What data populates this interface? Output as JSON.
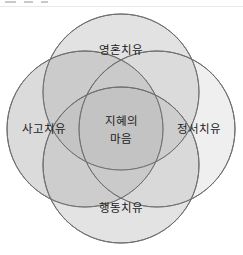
{
  "figure": {
    "name": "four-circle-venn-diagram",
    "background_color": "#ffffff",
    "stroke_color": "#6e6e6e"
  },
  "top_strip": {
    "present": true,
    "description": "clipped-toolbar-remnant"
  },
  "diagram": {
    "center": {
      "line1": "지혜의",
      "line2": "마음",
      "fill": "#d9d9d9"
    },
    "circles": [
      {
        "id": "top",
        "label": "영혼치유",
        "fill": "#e0e0e0",
        "cx": 121,
        "cy": 85,
        "r": 78
      },
      {
        "id": "left",
        "label": "사고치유",
        "fill": "#d6d6d6",
        "cx": 85,
        "cy": 122,
        "r": 78
      },
      {
        "id": "right",
        "label": "정서치유",
        "fill": "#ebebeb",
        "cx": 157,
        "cy": 122,
        "r": 78
      },
      {
        "id": "bottom",
        "label": "행동치유",
        "fill": "#dedede",
        "cx": 121,
        "cy": 158,
        "r": 78
      }
    ],
    "label_positions": {
      "top": {
        "x": 121,
        "y": 43
      },
      "left": {
        "x": 44,
        "y": 122
      },
      "right": {
        "x": 199,
        "y": 122
      },
      "bottom": {
        "x": 121,
        "y": 201
      },
      "center_line1": {
        "x": 121,
        "y": 114
      },
      "center_line2": {
        "x": 121,
        "y": 132
      }
    }
  }
}
